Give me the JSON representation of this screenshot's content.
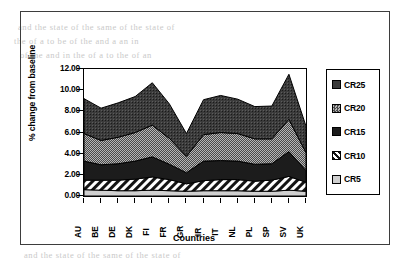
{
  "figure": {
    "axis_title_x": "Countries",
    "axis_title_y": "% change from baseline"
  },
  "legend": {
    "items": [
      {
        "label": "CR25",
        "pattern": "solid-dark",
        "color": "#3a3a3a"
      },
      {
        "label": "CR20",
        "pattern": "checker-gray",
        "color": "#9a9a9a"
      },
      {
        "label": "CR15",
        "pattern": "solid-black",
        "color": "#1c1c1c"
      },
      {
        "label": "CR10",
        "pattern": "diagonal-hatch",
        "color": "#ffffff"
      },
      {
        "label": "CR5",
        "pattern": "light-gray",
        "color": "#cfcfcf"
      }
    ]
  },
  "background_text": [
    "and the state of the same of the state of",
    "the of a to be of the and a an in",
    "of the and in the of a to the of an"
  ],
  "chart_data": {
    "type": "area",
    "stacked": true,
    "title": "",
    "xlabel": "Countries",
    "ylabel": "% change from baseline",
    "categories": [
      "AU",
      "BE",
      "DE",
      "DK",
      "FI",
      "FR",
      "GR",
      "IR",
      "IT",
      "NL",
      "PL",
      "SP",
      "SV",
      "UK"
    ],
    "ylim": [
      0,
      12
    ],
    "ytick_labels": [
      "0.00",
      "2.00",
      "4.00",
      "6.00",
      "8.00",
      "10.00",
      "12.00"
    ],
    "ytick_values": [
      0,
      2,
      4,
      6,
      8,
      10,
      12
    ],
    "grid": false,
    "legend_position": "right",
    "series": [
      {
        "name": "CR5",
        "values": [
          0.6,
          0.55,
          0.5,
          0.5,
          0.55,
          0.5,
          0.45,
          0.5,
          0.5,
          0.5,
          0.45,
          0.45,
          0.55,
          0.45
        ]
      },
      {
        "name": "CR10",
        "values": [
          0.9,
          0.95,
          1.0,
          1.1,
          1.25,
          1.05,
          0.7,
          0.95,
          1.05,
          1.05,
          0.95,
          1.05,
          1.3,
          0.85
        ]
      },
      {
        "name": "CR15",
        "values": [
          1.8,
          1.45,
          1.55,
          1.7,
          1.9,
          1.45,
          1.05,
          1.85,
          1.8,
          1.75,
          1.6,
          1.55,
          2.35,
          1.1
        ]
      },
      {
        "name": "CR20",
        "values": [
          2.6,
          2.3,
          2.5,
          2.7,
          3.0,
          2.45,
          1.55,
          2.5,
          2.65,
          2.6,
          2.4,
          2.35,
          3.05,
          1.7
        ]
      },
      {
        "name": "CR25",
        "values": [
          3.3,
          3.05,
          3.25,
          3.4,
          4.0,
          3.25,
          2.15,
          3.3,
          3.5,
          3.25,
          3.05,
          3.1,
          4.25,
          2.5
        ]
      }
    ],
    "cumulative_totals": [
      9.2,
      8.3,
      8.8,
      9.4,
      10.7,
      8.7,
      5.9,
      9.1,
      9.5,
      9.15,
      8.45,
      8.5,
      11.5,
      6.6
    ]
  }
}
